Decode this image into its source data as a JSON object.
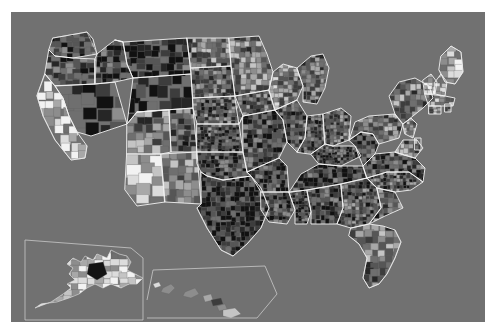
{
  "figure": {
    "type": "choropleth-map",
    "title": "",
    "subtitle": "",
    "legend": "",
    "axis_labels": "",
    "region": "United States",
    "geography_level": "county",
    "colormap": "grayscale",
    "background_color": "#717171",
    "panel_border_color": "#ffffff",
    "state_boundary_color": "#f2f2f2",
    "county_boundary_color": "#5e5e5e",
    "inset_box_color": "#c9c9c9",
    "width": 497,
    "height": 334
  },
  "chart_data": {
    "type": "heatmap",
    "title": "",
    "xlabel": "",
    "ylabel": "",
    "grid": false,
    "legend_position": "none",
    "colormap": "grayscale",
    "value_scale": {
      "min_color": "#f5f5f5",
      "max_color": "#0d0d0d",
      "steps": [
        "#f2f2f2",
        "#dcdcdc",
        "#c4c4c4",
        "#a8a8a8",
        "#8d8d8d",
        "#6f6f6f",
        "#565656",
        "#3d3d3d",
        "#262626",
        "#111111"
      ]
    },
    "regions": [
      {
        "name": "Washington",
        "tone": "dark",
        "value": 0.72
      },
      {
        "name": "Oregon",
        "tone": "mixed-dark",
        "value": 0.66
      },
      {
        "name": "California",
        "tone": "light",
        "value": 0.24
      },
      {
        "name": "Nevada",
        "tone": "dark",
        "value": 0.78
      },
      {
        "name": "Idaho",
        "tone": "dark",
        "value": 0.74
      },
      {
        "name": "Montana",
        "tone": "dark",
        "value": 0.8
      },
      {
        "name": "Wyoming",
        "tone": "dark",
        "value": 0.76
      },
      {
        "name": "Utah",
        "tone": "mixed",
        "value": 0.55
      },
      {
        "name": "Colorado",
        "tone": "mixed-dark",
        "value": 0.63
      },
      {
        "name": "Arizona",
        "tone": "light",
        "value": 0.3
      },
      {
        "name": "New Mexico",
        "tone": "mixed",
        "value": 0.5
      },
      {
        "name": "North Dakota",
        "tone": "mixed",
        "value": 0.52
      },
      {
        "name": "South Dakota",
        "tone": "mixed-dark",
        "value": 0.6
      },
      {
        "name": "Nebraska",
        "tone": "mixed-dark",
        "value": 0.64
      },
      {
        "name": "Kansas",
        "tone": "dark",
        "value": 0.7
      },
      {
        "name": "Oklahoma",
        "tone": "dark",
        "value": 0.72
      },
      {
        "name": "Texas",
        "tone": "very-dark",
        "value": 0.85
      },
      {
        "name": "Minnesota",
        "tone": "mixed",
        "value": 0.5
      },
      {
        "name": "Iowa",
        "tone": "mixed-dark",
        "value": 0.62
      },
      {
        "name": "Missouri",
        "tone": "dark",
        "value": 0.71
      },
      {
        "name": "Arkansas",
        "tone": "dark",
        "value": 0.74
      },
      {
        "name": "Louisiana",
        "tone": "dark",
        "value": 0.73
      },
      {
        "name": "Wisconsin",
        "tone": "mixed",
        "value": 0.48
      },
      {
        "name": "Illinois",
        "tone": "dark",
        "value": 0.68
      },
      {
        "name": "Michigan",
        "tone": "mixed-dark",
        "value": 0.6
      },
      {
        "name": "Indiana",
        "tone": "dark",
        "value": 0.69
      },
      {
        "name": "Ohio",
        "tone": "mixed-dark",
        "value": 0.61
      },
      {
        "name": "Kentucky",
        "tone": "dark",
        "value": 0.75
      },
      {
        "name": "Tennessee",
        "tone": "dark",
        "value": 0.76
      },
      {
        "name": "Mississippi",
        "tone": "dark",
        "value": 0.78
      },
      {
        "name": "Alabama",
        "tone": "dark",
        "value": 0.77
      },
      {
        "name": "Georgia",
        "tone": "mixed-dark",
        "value": 0.65
      },
      {
        "name": "Florida",
        "tone": "mixed",
        "value": 0.54
      },
      {
        "name": "South Carolina",
        "tone": "mixed-dark",
        "value": 0.63
      },
      {
        "name": "North Carolina",
        "tone": "mixed-dark",
        "value": 0.64
      },
      {
        "name": "Virginia",
        "tone": "mixed-dark",
        "value": 0.66
      },
      {
        "name": "West Virginia",
        "tone": "dark",
        "value": 0.72
      },
      {
        "name": "Pennsylvania",
        "tone": "mixed",
        "value": 0.56
      },
      {
        "name": "New York",
        "tone": "mixed",
        "value": 0.52
      },
      {
        "name": "Maine",
        "tone": "light",
        "value": 0.3
      },
      {
        "name": "Vermont",
        "tone": "light",
        "value": 0.32
      },
      {
        "name": "New Hampshire",
        "tone": "light",
        "value": 0.33
      },
      {
        "name": "Massachusetts",
        "tone": "mixed",
        "value": 0.45
      },
      {
        "name": "Alaska",
        "tone": "light",
        "value": 0.22
      },
      {
        "name": "Hawaii",
        "tone": "mixed",
        "value": 0.5
      }
    ]
  },
  "insets": [
    {
      "name": "alaska-inset",
      "label": "",
      "shape": "box"
    },
    {
      "name": "hawaii-inset",
      "label": "",
      "shape": "angled-box"
    }
  ]
}
